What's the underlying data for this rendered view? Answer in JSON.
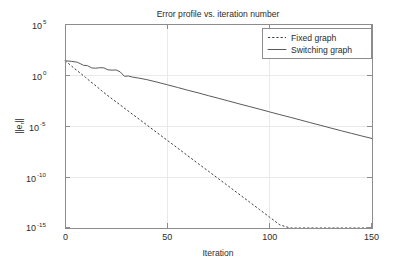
{
  "chart_data": {
    "type": "line",
    "title": "Error profile vs. iteration number",
    "xlabel": "Iteration",
    "ylabel": "||e_r||",
    "ylabel_base": "||e",
    "ylabel_sub": "r",
    "ylabel_tail": "||",
    "xlim": [
      0,
      150
    ],
    "ylim": [
      1e-15,
      100000.0
    ],
    "yscale": "log",
    "xscale": "linear",
    "grid": true,
    "legend_position": "top-right",
    "xticks": [
      0,
      50,
      100,
      150
    ],
    "xtick_labels": [
      "0",
      "50",
      "100",
      "150"
    ],
    "yticks": [
      100000,
      1,
      1e-05,
      1e-10,
      1e-15
    ],
    "ytick_labels": [
      "10^5",
      "10^0",
      "10^-5",
      "10^-10",
      "10^-15"
    ],
    "ytick_mantissa": [
      "10",
      "10",
      "10",
      "10",
      "10"
    ],
    "ytick_exponents": [
      "5",
      "0",
      "-5",
      "-10",
      "-15"
    ],
    "series": [
      {
        "name": "Fixed graph",
        "style": "dashed",
        "color": "#3d3d3d",
        "x": [
          0,
          2,
          4,
          6,
          8,
          10,
          12,
          14,
          16,
          18,
          20,
          25,
          30,
          35,
          40,
          45,
          50,
          55,
          60,
          65,
          70,
          75,
          80,
          85,
          90,
          95,
          100,
          105,
          110,
          115,
          120,
          125,
          130,
          135,
          140,
          145,
          150
        ],
        "y": [
          25.0,
          12.0,
          5.5,
          2.6,
          1.25,
          0.58,
          0.27,
          0.13,
          0.06,
          0.028,
          0.013,
          0.0023,
          0.0004,
          7.1e-05,
          1.25e-05,
          2.2e-06,
          3.9e-07,
          6.9e-08,
          1.2e-08,
          2.1e-09,
          3.8e-10,
          6.7e-11,
          1.2e-11,
          2.1e-12,
          3.7e-13,
          6.5e-14,
          1.15e-14,
          2e-15,
          3.6e-16,
          6.3e-17,
          1.1e-17,
          2e-18,
          3.5e-19,
          6.2e-20,
          1.1e-20,
          1.9e-21,
          3.4e-22
        ]
      },
      {
        "name": "Switching graph",
        "style": "solid",
        "color": "#5a5a5a",
        "x": [
          0,
          3,
          6,
          9,
          11,
          13,
          15,
          17,
          19,
          21,
          23,
          25,
          27,
          29,
          31,
          33,
          36,
          40,
          45,
          50,
          55,
          60,
          65,
          70,
          75,
          80,
          85,
          90,
          95,
          100,
          105,
          110,
          115,
          120,
          125,
          130,
          135,
          140,
          145,
          150
        ],
        "y": [
          25.0,
          22.0,
          18.0,
          9.0,
          8.2,
          5.0,
          4.6,
          5.2,
          5.0,
          3.2,
          3.0,
          3.1,
          2.0,
          0.75,
          0.8,
          0.62,
          0.5,
          0.35,
          0.2,
          0.11,
          0.06,
          0.032,
          0.018,
          0.0095,
          0.0052,
          0.0028,
          0.0015,
          0.00082,
          0.00045,
          0.00024,
          0.00013,
          7.2e-05,
          3.9e-05,
          2.1e-05,
          1.15e-05,
          6.2e-06,
          3.4e-06,
          1.9e-06,
          1.05e-06,
          6e-07
        ]
      }
    ]
  },
  "legend": {
    "items": [
      {
        "label": "Fixed graph",
        "style": "dashed"
      },
      {
        "label": "Switching graph",
        "style": "solid"
      }
    ]
  }
}
